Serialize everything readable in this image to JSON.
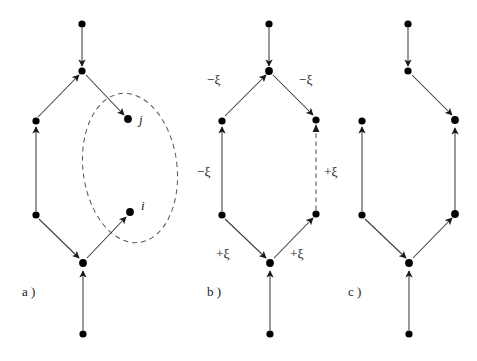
{
  "figure": {
    "title": "",
    "background_color": "#ffffff",
    "width": 477,
    "height": 361,
    "node_color": "#000000",
    "edge_color": "#3a3a3a",
    "dashed_color": "#555555"
  },
  "panels": [
    {
      "id": "a",
      "label": "a )",
      "label_x": 22,
      "label_y": 296,
      "description": "directed graph cycle with highlighted nodes i and j inside dashed ellipse",
      "node_labels": [
        {
          "text": "j",
          "x": 139,
          "y": 124
        },
        {
          "text": "i",
          "x": 141,
          "y": 210
        }
      ],
      "edge_labels": []
    },
    {
      "id": "b",
      "label": "b )",
      "label_x": 207,
      "label_y": 296,
      "description": "same graph annotated with plus and minus xi weights, right vertical edge dashed",
      "node_labels": [],
      "edge_labels": [
        {
          "text": "−ξ",
          "x": 207,
          "y": 84,
          "anchor": "start"
        },
        {
          "text": "−ξ",
          "x": 299,
          "y": 84,
          "anchor": "start"
        },
        {
          "text": "−ξ",
          "x": 197,
          "y": 176,
          "anchor": "start"
        },
        {
          "text": "+ξ",
          "x": 317,
          "y": 176,
          "anchor": "start"
        },
        {
          "text": "+ξ",
          "x": 216,
          "y": 258,
          "anchor": "start"
        },
        {
          "text": "+ξ",
          "x": 290,
          "y": 258,
          "anchor": "start"
        }
      ]
    },
    {
      "id": "c",
      "label": "c )",
      "label_x": 348,
      "label_y": 296,
      "description": "reconnected graph after edge reversal, top junction links directly down-right",
      "node_labels": [],
      "edge_labels": []
    }
  ],
  "symbols": {
    "xi": "ξ",
    "minus": "−",
    "plus": "+"
  }
}
